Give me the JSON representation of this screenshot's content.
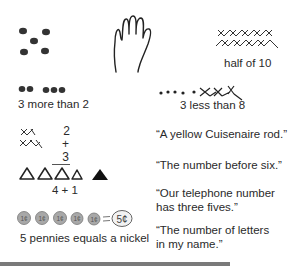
{
  "figure": {
    "left_column": [
      {
        "id": "dice",
        "caption": "",
        "representation": "five dots in dice pattern"
      },
      {
        "id": "dots-3-2",
        "caption": "3 more than 2",
        "representation": "2 dots and 3 dots"
      },
      {
        "id": "addition",
        "caption": "",
        "top": "2",
        "bottom": "+ 3",
        "representation": "2 x marks over 3 x marks"
      },
      {
        "id": "triangles",
        "caption": "4 + 1",
        "representation": "4 open triangles and 1 filled triangle"
      },
      {
        "id": "pennies",
        "caption": "5 pennies equals a nickel",
        "coin_label": "1¢",
        "equals": "=",
        "nickel_label": "5¢",
        "coin_count": 5
      }
    ],
    "right_column": [
      {
        "id": "hand",
        "caption": "",
        "representation": "open hand, five fingers"
      },
      {
        "id": "half-of-10",
        "caption": "half of 10",
        "representation": "two rows of five x marks"
      },
      {
        "id": "less-than-8",
        "caption": "3 less than 8",
        "representation": "five dots followed by three crossed marks"
      },
      {
        "id": "quote-1",
        "text": "“A yellow Cuisenaire rod.”"
      },
      {
        "id": "quote-2",
        "text": "“The number before six.”"
      },
      {
        "id": "quote-3",
        "line1": "“Our telephone number",
        "line2": "has three fives.”"
      },
      {
        "id": "quote-4",
        "line1": "“The number of letters",
        "line2": "in my name.”"
      }
    ],
    "colors": {
      "ink": "#2a2a2a",
      "coin_fill": "#a8a8a8",
      "rule": "#7a7a7a"
    }
  }
}
